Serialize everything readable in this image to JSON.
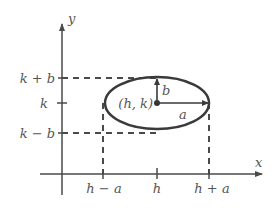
{
  "diagram": {
    "colors": {
      "stroke": "#4a4a4a",
      "text": "#555555",
      "background": "#ffffff"
    },
    "axes": {
      "x_label": "x",
      "y_label": "y"
    },
    "y_ticks": [
      "k + b",
      "k",
      "k − b"
    ],
    "x_ticks": [
      "h − a",
      "h",
      "h + a"
    ],
    "center_label": "(h, k)",
    "semi_axis_labels": {
      "vertical": "b",
      "horizontal": "a"
    }
  }
}
